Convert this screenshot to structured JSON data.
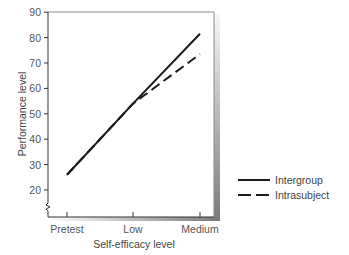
{
  "chart_data": {
    "type": "line",
    "title": "",
    "xlabel": "Self-efficacy level",
    "ylabel": "Performance level",
    "categories": [
      "Pretest",
      "Low",
      "Medium"
    ],
    "yticks": [
      20,
      30,
      40,
      50,
      60,
      70,
      80,
      90
    ],
    "ylim": [
      20,
      90
    ],
    "y_axis_break": true,
    "grid": false,
    "legend_position": "right",
    "series": [
      {
        "name": "Intergroup",
        "style": "solid",
        "color": "#1a1a1a",
        "values": [
          26,
          54,
          81.5
        ]
      },
      {
        "name": "Intrasubject",
        "style": "dashed",
        "color": "#1a1a1a",
        "values": [
          26,
          54,
          73.5
        ]
      }
    ]
  },
  "legend": {
    "items": [
      {
        "label": "Intergroup",
        "style": "solid"
      },
      {
        "label": "Intrasubject",
        "style": "dashed"
      }
    ]
  },
  "colors": {
    "axis": "#333333",
    "frame": "#8a8a8a",
    "shadow_light": "#f4f4f4",
    "shadow_dark": "#7a7a7a",
    "text": "#4a4a4a"
  }
}
